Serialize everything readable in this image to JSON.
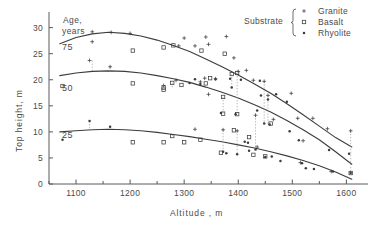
{
  "chart_data": {
    "type": "scatter",
    "title": "",
    "xlabel": "Altitude , m",
    "ylabel": "Top height, m",
    "xlim": [
      1050,
      1640
    ],
    "ylim": [
      0,
      33
    ],
    "xticks": [
      1100,
      1200,
      1300,
      1400,
      1500,
      1600
    ],
    "xtick_labels": [
      "1100",
      "1200",
      "1300",
      "1400",
      "1500",
      "1600"
    ],
    "xminor_step": 50,
    "yticks": [
      0,
      5,
      10,
      15,
      20,
      25,
      30
    ],
    "ytick_labels": [
      "0",
      "5",
      "10",
      "15",
      "20",
      "25",
      "30"
    ],
    "grid": false,
    "legend": {
      "title": "Substrate",
      "position": "top-right",
      "entries": [
        {
          "name": "Granite",
          "marker": "plus"
        },
        {
          "name": "Basalt",
          "marker": "square"
        },
        {
          "name": "Rhyolite",
          "marker": "dot"
        }
      ]
    },
    "annotations": {
      "group_title_line1": "Age,",
      "group_title_line2": "years",
      "curve_labels": [
        "75",
        "50",
        "25"
      ]
    },
    "curves": [
      {
        "name": "75",
        "age_years": 75,
        "points": [
          [
            1070,
            26.9
          ],
          [
            1100,
            28.1
          ],
          [
            1130,
            28.8
          ],
          [
            1160,
            29.1
          ],
          [
            1190,
            28.9
          ],
          [
            1220,
            28.4
          ],
          [
            1250,
            27.6
          ],
          [
            1280,
            26.6
          ],
          [
            1310,
            25.4
          ],
          [
            1340,
            24.0
          ],
          [
            1370,
            22.5
          ],
          [
            1400,
            20.9
          ],
          [
            1430,
            19.2
          ],
          [
            1460,
            17.4
          ],
          [
            1490,
            15.4
          ],
          [
            1520,
            13.3
          ],
          [
            1550,
            11.1
          ],
          [
            1580,
            8.9
          ],
          [
            1610,
            7.1
          ]
        ]
      },
      {
        "name": "50",
        "age_years": 50,
        "points": [
          [
            1070,
            20.8
          ],
          [
            1100,
            21.3
          ],
          [
            1130,
            21.6
          ],
          [
            1160,
            21.7
          ],
          [
            1190,
            21.6
          ],
          [
            1220,
            21.3
          ],
          [
            1250,
            20.8
          ],
          [
            1280,
            20.2
          ],
          [
            1310,
            19.5
          ],
          [
            1340,
            18.6
          ],
          [
            1370,
            17.6
          ],
          [
            1400,
            16.5
          ],
          [
            1430,
            15.2
          ],
          [
            1460,
            13.8
          ],
          [
            1490,
            12.2
          ],
          [
            1520,
            10.4
          ],
          [
            1550,
            8.5
          ],
          [
            1580,
            6.2
          ],
          [
            1610,
            3.8
          ]
        ]
      },
      {
        "name": "25",
        "age_years": 25,
        "points": [
          [
            1070,
            10.0
          ],
          [
            1100,
            10.2
          ],
          [
            1130,
            10.4
          ],
          [
            1160,
            10.5
          ],
          [
            1190,
            10.4
          ],
          [
            1220,
            10.2
          ],
          [
            1250,
            9.9
          ],
          [
            1280,
            9.5
          ],
          [
            1310,
            9.1
          ],
          [
            1340,
            8.6
          ],
          [
            1370,
            8.1
          ],
          [
            1400,
            7.5
          ],
          [
            1430,
            6.9
          ],
          [
            1460,
            6.2
          ],
          [
            1490,
            5.4
          ],
          [
            1520,
            4.5
          ],
          [
            1550,
            3.5
          ],
          [
            1580,
            2.3
          ],
          [
            1610,
            0.9
          ]
        ]
      }
    ],
    "series": [
      {
        "name": "Granite",
        "marker": "plus",
        "points": [
          [
            1130,
            29.2
          ],
          [
            1130,
            27.3
          ],
          [
            1125,
            23.7
          ],
          [
            1165,
            29.1
          ],
          [
            1163,
            22.5
          ],
          [
            1200,
            28.9
          ],
          [
            1300,
            28.0
          ],
          [
            1320,
            26.5
          ],
          [
            1340,
            28.2
          ],
          [
            1345,
            26.8
          ],
          [
            1338,
            20.3
          ],
          [
            1330,
            19.6
          ],
          [
            1345,
            17.2
          ],
          [
            1378,
            28.3
          ],
          [
            1372,
            10.4
          ],
          [
            1392,
            24.2
          ],
          [
            1400,
            21.6
          ],
          [
            1398,
            10.2
          ],
          [
            1415,
            21.8
          ],
          [
            1428,
            19.9
          ],
          [
            1432,
            13.2
          ],
          [
            1435,
            7.1
          ],
          [
            1448,
            19.7
          ],
          [
            1455,
            17.0
          ],
          [
            1465,
            12.4
          ],
          [
            1498,
            17.4
          ],
          [
            1510,
            12.6
          ],
          [
            1515,
            4.1
          ],
          [
            1520,
            8.3
          ],
          [
            1538,
            12.6
          ],
          [
            1565,
            10.6
          ],
          [
            1572,
            2.4
          ],
          [
            1608,
            10.2
          ],
          [
            1320,
            10.5
          ],
          [
            1285,
            19.9
          ],
          [
            1358,
            20.2
          ],
          [
            1290,
            26.5
          ],
          [
            1262,
            18.9
          ]
        ]
      },
      {
        "name": "Basalt",
        "marker": "square",
        "points": [
          [
            1075,
            18.8
          ],
          [
            1205,
            25.6
          ],
          [
            1205,
            19.3
          ],
          [
            1205,
            8.0
          ],
          [
            1262,
            26.2
          ],
          [
            1262,
            18.5
          ],
          [
            1262,
            18.1
          ],
          [
            1262,
            8.0
          ],
          [
            1280,
            26.6
          ],
          [
            1278,
            19.4
          ],
          [
            1278,
            9.2
          ],
          [
            1295,
            19.0
          ],
          [
            1300,
            8.0
          ],
          [
            1332,
            25.6
          ],
          [
            1330,
            8.5
          ],
          [
            1340,
            19.3
          ],
          [
            1372,
            16.7
          ],
          [
            1372,
            13.5
          ],
          [
            1375,
            25.0
          ],
          [
            1388,
            21.1
          ],
          [
            1392,
            10.3
          ],
          [
            1398,
            21.3
          ],
          [
            1398,
            13.4
          ],
          [
            1420,
            9.0
          ],
          [
            1428,
            5.6
          ],
          [
            1450,
            5.3
          ],
          [
            1460,
            11.6
          ],
          [
            1608,
            2.1
          ],
          [
            1348,
            20.3
          ],
          [
            1368,
            6.0
          ]
        ]
      },
      {
        "name": "Rhyolite",
        "marker": "dot",
        "points": [
          [
            1075,
            8.5
          ],
          [
            1125,
            12.1
          ],
          [
            1163,
            11.0
          ],
          [
            1310,
            19.4
          ],
          [
            1320,
            20.1
          ],
          [
            1330,
            19.2
          ],
          [
            1358,
            20.1
          ],
          [
            1368,
            13.6
          ],
          [
            1372,
            6.2
          ],
          [
            1378,
            5.9
          ],
          [
            1385,
            20.2
          ],
          [
            1388,
            18.5
          ],
          [
            1395,
            13.4
          ],
          [
            1398,
            5.7
          ],
          [
            1412,
            8.1
          ],
          [
            1418,
            7.9
          ],
          [
            1420,
            6.4
          ],
          [
            1432,
            6.6
          ],
          [
            1440,
            19.8
          ],
          [
            1442,
            17.0
          ],
          [
            1448,
            11.6
          ],
          [
            1450,
            5.2
          ],
          [
            1455,
            16.2
          ],
          [
            1458,
            11.4
          ],
          [
            1462,
            5.3
          ],
          [
            1470,
            17.2
          ],
          [
            1478,
            4.4
          ],
          [
            1490,
            15.8
          ],
          [
            1495,
            10.1
          ],
          [
            1512,
            8.4
          ],
          [
            1518,
            4.0
          ],
          [
            1525,
            3.0
          ],
          [
            1540,
            2.9
          ],
          [
            1568,
            6.5
          ],
          [
            1575,
            2.4
          ],
          [
            1605,
            5.8
          ],
          [
            1608,
            2.1
          ],
          [
            1435,
            14.1
          ],
          [
            1405,
            20.0
          ]
        ]
      }
    ],
    "connectors": [
      [
        1130,
        23.7,
        1130,
        21.4
      ],
      [
        1163,
        22.5,
        1163,
        21.6
      ],
      [
        1125,
        12.1,
        1125,
        10.3
      ],
      [
        1163,
        11.0,
        1163,
        10.5
      ],
      [
        1278,
        19.4,
        1278,
        18.3
      ],
      [
        1278,
        9.2,
        1278,
        9.5
      ],
      [
        1372,
        16.7,
        1372,
        13.5
      ],
      [
        1398,
        21.3,
        1398,
        13.4
      ],
      [
        1388,
        21.1,
        1388,
        18.5
      ],
      [
        1432,
        13.2,
        1432,
        6.6
      ],
      [
        1448,
        19.7,
        1448,
        11.6
      ],
      [
        1455,
        17.0,
        1455,
        11.4
      ],
      [
        1372,
        10.4,
        1372,
        6.2
      ],
      [
        1398,
        10.2,
        1398,
        5.7
      ],
      [
        1608,
        10.2,
        1608,
        2.1
      ],
      [
        1575,
        2.4,
        1575,
        2.4
      ]
    ],
    "colors": {
      "axis": "#5a5a5a",
      "curve": "#3c3c3c",
      "marker": "#3c3c3c",
      "connector": "#9a9a9a",
      "text": "#4a4a4a",
      "background": "#ffffff"
    }
  }
}
